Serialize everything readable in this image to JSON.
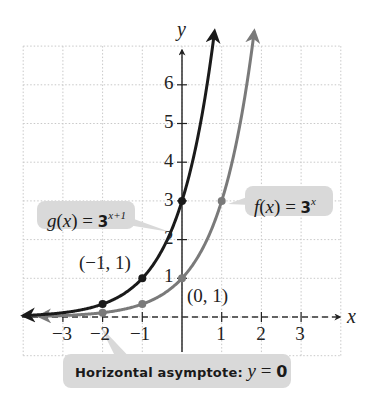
{
  "chart_data": {
    "type": "line",
    "title": "",
    "xlabel": "x",
    "ylabel": "y",
    "xlim": [
      -4,
      4
    ],
    "ylim": [
      -1,
      7
    ],
    "grid": true,
    "x_ticks": [
      "-3",
      "-2",
      "-1",
      "1",
      "2",
      "3"
    ],
    "y_ticks": [
      "1",
      "2",
      "3",
      "4",
      "5",
      "6"
    ],
    "series": [
      {
        "name": "f(x) = 3^x",
        "color": "#7a7a7a",
        "points": [
          [
            -2,
            0.111
          ],
          [
            -1,
            0.333
          ],
          [
            0,
            1
          ],
          [
            1,
            3
          ]
        ]
      },
      {
        "name": "g(x) = 3^(x+1)",
        "color": "#1a1a1a",
        "points": [
          [
            -2,
            0.333
          ],
          [
            -1,
            1
          ],
          [
            0,
            3
          ]
        ]
      }
    ],
    "asymptote": {
      "type": "horizontal",
      "y": 0,
      "style": "dashed"
    },
    "annotations": [
      {
        "text": "(-1, 1)",
        "x": -1,
        "y": 1
      },
      {
        "text": "(0, 1)",
        "x": 0,
        "y": 1
      }
    ]
  },
  "labels": {
    "x_axis": "x",
    "y_axis": "y",
    "x_ticks": [
      "−3",
      "−2",
      "−1",
      "1",
      "2",
      "3"
    ],
    "y_ticks": [
      "1",
      "2",
      "3",
      "4",
      "5",
      "6"
    ],
    "point_g": "(−1, 1)",
    "point_f": "(0, 1)"
  },
  "callouts": {
    "g": {
      "name": "g",
      "open": "(",
      "var": "x",
      "close": ")",
      "eq": " = ",
      "base": "3",
      "exp": "x+1"
    },
    "f": {
      "name": "f",
      "open": "(",
      "var": "x",
      "close": ")",
      "eq": " = ",
      "base": "3",
      "exp": "x"
    },
    "asymptote": {
      "prefix": "Horizontal asymptote: ",
      "var": "y",
      "eq": " = ",
      "value": "0"
    }
  },
  "colors": {
    "f_curve": "#7a7a7a",
    "g_curve": "#1a1a1a",
    "grid": "#c8c8c8",
    "callout_bg": "#d9d9d9"
  }
}
